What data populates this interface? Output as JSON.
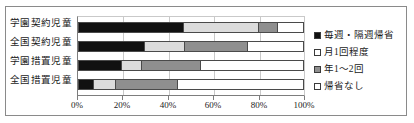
{
  "chart_data": {
    "type": "bar",
    "subtype": "stacked-horizontal-100pct",
    "title": "",
    "xlabel": "",
    "ylabel": "",
    "xlim": [
      0,
      100
    ],
    "xticks": [
      "0%",
      "20%",
      "40%",
      "60%",
      "80%",
      "100%"
    ],
    "xtick_values": [
      0,
      20,
      40,
      60,
      80,
      100
    ],
    "grid": true,
    "legend_position": "right",
    "categories": [
      "学園契約児童",
      "全国契約児童",
      "学園措置児童",
      "全国措置児童"
    ],
    "series": [
      {
        "name": "毎週・隔週帰省",
        "color": "#111111",
        "values": [
          46.5,
          29.0,
          19.0,
          6.5
        ]
      },
      {
        "name": "月1回程度",
        "color": "#dcdcdc",
        "values": [
          33.0,
          18.0,
          9.0,
          10.0
        ]
      },
      {
        "name": "年1～2回",
        "color": "#8f8f8f",
        "values": [
          8.5,
          28.0,
          26.0,
          27.5
        ]
      },
      {
        "name": "帰省なし",
        "color": "#ffffff",
        "values": [
          12.0,
          25.0,
          46.0,
          56.0
        ]
      }
    ]
  },
  "legend": {
    "items": [
      {
        "label": "毎週・隔週帰省",
        "color": "#111111"
      },
      {
        "label": "月1回程度",
        "color": "#ffffff"
      },
      {
        "label": "年1～2回",
        "color": "#8f8f8f"
      },
      {
        "label": "帰省なし",
        "color": "#ffffff"
      }
    ]
  }
}
